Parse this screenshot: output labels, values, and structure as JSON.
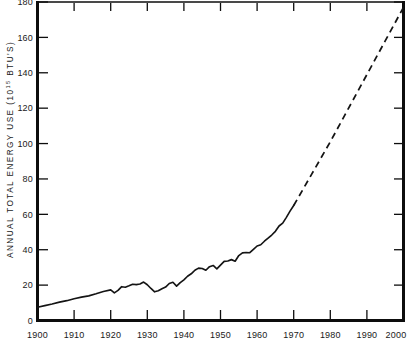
{
  "chart_data": {
    "type": "line",
    "title": "",
    "xlabel": "",
    "ylabel": "ANNUAL TOTAL ENERGY USE (10",
    "ylabel_sup": "15",
    "ylabel_tail": " BTU'S)",
    "xlim": [
      1900,
      2000
    ],
    "ylim": [
      0,
      180
    ],
    "grid": false,
    "legend": "none",
    "x_ticks": [
      "1900",
      "1910",
      "1920",
      "1930",
      "1940",
      "1950",
      "1960",
      "1970",
      "1980",
      "1990",
      "2000"
    ],
    "x_tick_values": [
      1900,
      1910,
      1920,
      1930,
      1940,
      1950,
      1960,
      1970,
      1980,
      1990,
      2000
    ],
    "y_ticks": [
      "0",
      "20",
      "40",
      "60",
      "80",
      "100",
      "120",
      "140",
      "160",
      "180"
    ],
    "y_tick_values": [
      0,
      20,
      40,
      60,
      80,
      100,
      120,
      140,
      160,
      180
    ],
    "series": [
      {
        "name": "Historical energy use",
        "style": "solid",
        "x": [
          1900,
          1902,
          1904,
          1906,
          1908,
          1910,
          1912,
          1914,
          1916,
          1918,
          1920,
          1921,
          1922,
          1923,
          1924,
          1925,
          1926,
          1927,
          1928,
          1929,
          1930,
          1931,
          1932,
          1933,
          1934,
          1935,
          1936,
          1937,
          1938,
          1939,
          1940,
          1941,
          1942,
          1943,
          1944,
          1945,
          1946,
          1947,
          1948,
          1949,
          1950,
          1951,
          1952,
          1953,
          1954,
          1955,
          1956,
          1957,
          1958,
          1959,
          1960,
          1961,
          1962,
          1963,
          1964,
          1965,
          1966,
          1967,
          1968,
          1969,
          1970
        ],
        "values": [
          7.5,
          8.4,
          9.3,
          10.4,
          11.2,
          12.3,
          13.2,
          13.9,
          15.1,
          16.4,
          17.3,
          15.6,
          17.0,
          19.1,
          18.8,
          19.6,
          20.5,
          20.3,
          20.6,
          21.7,
          20.2,
          18.1,
          16.2,
          16.8,
          17.9,
          18.9,
          20.9,
          21.6,
          19.4,
          21.4,
          23.0,
          25.0,
          26.4,
          28.4,
          29.6,
          29.4,
          28.4,
          30.4,
          31.1,
          29.2,
          31.3,
          33.4,
          33.6,
          34.4,
          33.5,
          36.7,
          38.2,
          38.4,
          38.3,
          40.2,
          42.1,
          42.8,
          44.8,
          46.5,
          48.3,
          50.4,
          53.4,
          55.0,
          58.3,
          61.8,
          65.0
        ]
      },
      {
        "name": "Projected energy use",
        "style": "dashed",
        "x": [
          1970,
          1975,
          1980,
          1985,
          1990,
          1995,
          2000
        ],
        "values": [
          65.0,
          83.0,
          101.0,
          120.0,
          139.0,
          158.0,
          177.0
        ]
      }
    ]
  }
}
